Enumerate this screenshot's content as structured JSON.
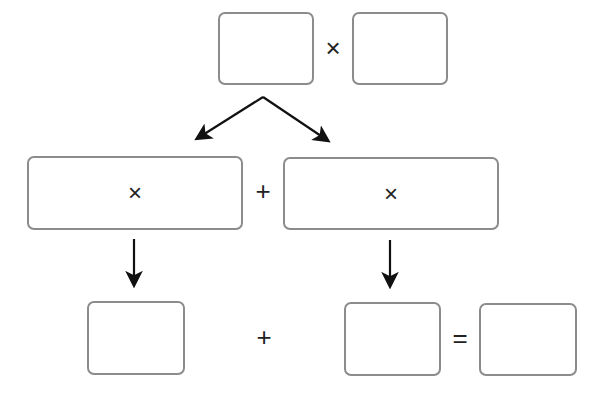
{
  "diagram": {
    "top": {
      "left_box": {
        "value": ""
      },
      "operator": "×",
      "right_box": {
        "value": ""
      }
    },
    "middle": {
      "left_box": {
        "value": "×"
      },
      "operator": "+",
      "right_box": {
        "value": "×"
      }
    },
    "bottom": {
      "left_box": {
        "value": ""
      },
      "operator_plus": "+",
      "middle_box": {
        "value": ""
      },
      "operator_equals": "=",
      "right_box": {
        "value": ""
      }
    },
    "colors": {
      "box_border": "#8c8c8c",
      "arrow": "#111111",
      "text": "#222222"
    }
  }
}
